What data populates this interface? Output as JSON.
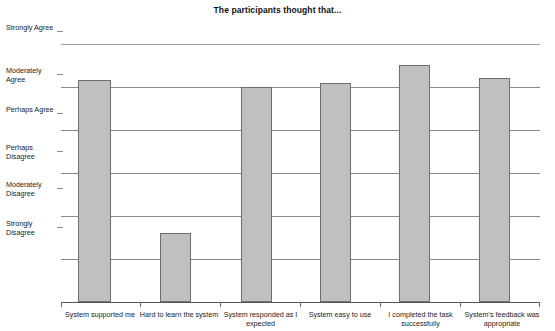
{
  "chart_data": {
    "type": "bar",
    "title": "The participants thought that...",
    "xlabel": "",
    "ylabel": "",
    "categories": [
      "System supported me",
      "Hard to learn the system",
      "System responded as I expected",
      "System easy to use",
      "I completed the task successfully",
      "System's feedback was appropriate"
    ],
    "values": [
      5.15,
      1.6,
      5.0,
      5.1,
      5.5,
      5.2
    ],
    "ytick_labels": [
      "Strongly Agree",
      "Moderately Agree",
      "Perhaps Agree",
      "Perhaps Disagree",
      "Moderately Disagree",
      "Strongly Disagree"
    ],
    "ytick_values": [
      6,
      5,
      4,
      3,
      2,
      1
    ],
    "ylim": [
      0,
      6.3
    ],
    "grid": true,
    "legend": "none",
    "bar_color": "#c0c0c0",
    "bar_edge_color": "#6e6e6e",
    "gridline_color": "#8a8a8a",
    "axis_color": "#555555"
  }
}
